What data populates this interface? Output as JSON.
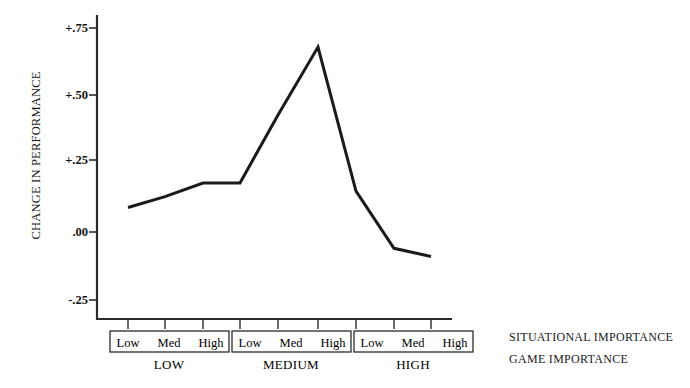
{
  "chart_data": {
    "type": "line",
    "title": "",
    "xlabel": "GAME IMPORTANCE",
    "ylabel": "CHANGE IN PERFORMANCE",
    "ylim": [
      -0.35,
      0.8
    ],
    "yticks": [
      0.75,
      0.5,
      0.25,
      0.0,
      -0.25
    ],
    "ytick_labels": [
      "+.75",
      "+.50",
      "+.25",
      ".00",
      "-.25"
    ],
    "grid": false,
    "legend": "none",
    "x_level1_label": "SITUATIONAL IMPORTANCE",
    "x_level2_label": "GAME IMPORTANCE",
    "groups": [
      {
        "name": "LOW",
        "levels": [
          "Low",
          "Med",
          "High"
        ]
      },
      {
        "name": "MEDIUM",
        "levels": [
          "Low",
          "Med",
          "High"
        ]
      },
      {
        "name": "HIGH",
        "levels": [
          "Low",
          "Med",
          "High"
        ]
      }
    ],
    "categories": [
      "LOW / Low",
      "LOW / Med",
      "LOW / High",
      "MEDIUM / Low",
      "MEDIUM / Med",
      "MEDIUM / High",
      "HIGH / Low",
      "HIGH / Med",
      "HIGH / High"
    ],
    "x": [
      1,
      2,
      3,
      4,
      5,
      6,
      7,
      8,
      9
    ],
    "values": [
      0.09,
      0.13,
      0.18,
      0.18,
      0.43,
      0.68,
      0.15,
      -0.06,
      -0.09
    ],
    "series": [
      {
        "name": "Change in performance",
        "values": [
          0.09,
          0.13,
          0.18,
          0.18,
          0.43,
          0.68,
          0.15,
          -0.06,
          -0.09
        ],
        "color": "#1a1a1a",
        "line_width": 3
      }
    ]
  },
  "axis": {
    "y_label": "CHANGE IN PERFORMANCE",
    "ticks": [
      {
        "label": "+.75"
      },
      {
        "label": "+.50"
      },
      {
        "label": "+.25"
      },
      {
        "label": ".00"
      },
      {
        "label": "-.25"
      }
    ]
  },
  "x_axis": {
    "groups": [
      {
        "name": "LOW",
        "cells": [
          {
            "label": "Low"
          },
          {
            "label": "Med"
          },
          {
            "label": "High"
          }
        ]
      },
      {
        "name": "MEDIUM",
        "cells": [
          {
            "label": "Low"
          },
          {
            "label": "Med"
          },
          {
            "label": "High"
          }
        ]
      },
      {
        "name": "HIGH",
        "cells": [
          {
            "label": "Low"
          },
          {
            "label": "Med"
          },
          {
            "label": "High"
          }
        ]
      }
    ],
    "captions": {
      "situational": "SITUATIONAL IMPORTANCE",
      "game": "GAME IMPORTANCE"
    }
  },
  "colors": {
    "line": "#1a1a1a",
    "axis": "#2b2b2b",
    "background": "#ffffff",
    "text": "#1a1a1a"
  }
}
